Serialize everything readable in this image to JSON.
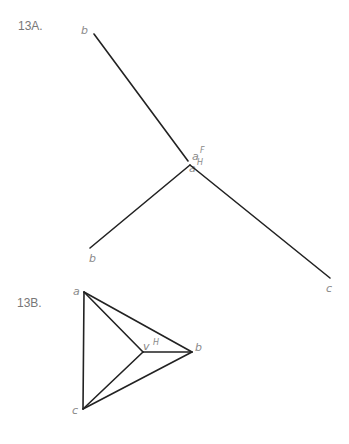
{
  "figure_13A": {
    "title": "13A.",
    "view_H": {
      "point_b": "b",
      "point_a": "a",
      "point_a_sup": "H"
    },
    "view_F": {
      "point_a": "a",
      "point_a_sup": "F",
      "point_b": "b",
      "point_c": "c"
    }
  },
  "figure_13B": {
    "title": "13B.",
    "point_a": "a",
    "point_b": "b",
    "point_c": "c",
    "point_v": "v",
    "point_v_sup": "H"
  },
  "colors": {
    "line": "#222222",
    "label": "#8a8a8a"
  }
}
